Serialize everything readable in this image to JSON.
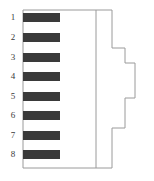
{
  "figure": {
    "kind": "connector-pinout-side-view",
    "pin_count": 8,
    "colors": {
      "pin_fill": "#3a3a3a",
      "outline": "#9a9a9a",
      "label_text": "#3a3a3a",
      "background": "#ffffff"
    }
  },
  "pins": [
    {
      "number": "1",
      "label_x": 6,
      "label_y": 13,
      "bar_x": 23,
      "bar_y": 13,
      "bar_w": 37,
      "bar_h": 9
    },
    {
      "number": "2",
      "label_x": 6,
      "label_y": 33,
      "bar_x": 23,
      "bar_y": 33,
      "bar_w": 37,
      "bar_h": 9
    },
    {
      "number": "3",
      "label_x": 6,
      "label_y": 53,
      "bar_x": 23,
      "bar_y": 53,
      "bar_w": 37,
      "bar_h": 9
    },
    {
      "number": "4",
      "label_x": 6,
      "label_y": 72,
      "bar_x": 23,
      "bar_y": 72,
      "bar_w": 37,
      "bar_h": 9
    },
    {
      "number": "5",
      "label_x": 6,
      "label_y": 92,
      "bar_x": 23,
      "bar_y": 92,
      "bar_w": 37,
      "bar_h": 9
    },
    {
      "number": "6",
      "label_x": 6,
      "label_y": 111,
      "bar_x": 23,
      "bar_y": 111,
      "bar_w": 37,
      "bar_h": 9
    },
    {
      "number": "7",
      "label_x": 6,
      "label_y": 131,
      "bar_x": 23,
      "bar_y": 131,
      "bar_w": 37,
      "bar_h": 9
    },
    {
      "number": "8",
      "label_x": 6,
      "label_y": 150,
      "bar_x": 23,
      "bar_y": 150,
      "bar_w": 37,
      "bar_h": 9
    }
  ],
  "geometry": {
    "body_outline_path": "M 23,10 L 112,10 L 112,48 L 125,48 L 125,63 L 135,63 L 135,98 L 125,98 L 125,128 L 112,128 L 112,168 L 23,168 L 23,10 Z",
    "divider_line": {
      "x1": 96,
      "y1": 10,
      "x2": 96,
      "y2": 168
    },
    "stroke_width": 1
  }
}
